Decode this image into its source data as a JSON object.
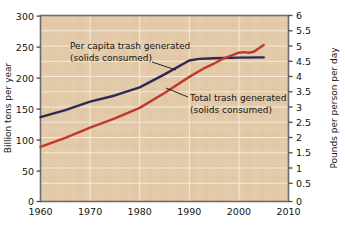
{
  "chart_data": {
    "type": "line",
    "title": "",
    "xlabel": "",
    "ylabel": "Billion tons per year",
    "y2label": "Pounds per person per day",
    "xlim": [
      1960,
      2010
    ],
    "ylim": [
      0,
      300
    ],
    "y2lim": [
      0,
      6
    ],
    "grid": true,
    "legend_position": "inline-annotations",
    "x_ticks": [
      "1960",
      "1970",
      "1980",
      "1990",
      "2000",
      "2010"
    ],
    "x_tick_values": [
      1960,
      1970,
      1980,
      1990,
      2000,
      2010
    ],
    "y_ticks": [
      "0",
      "50",
      "100",
      "150",
      "200",
      "250",
      "300"
    ],
    "y_tick_values": [
      0,
      50,
      100,
      150,
      200,
      250,
      300
    ],
    "y2_ticks": [
      "0",
      "0.5",
      "1",
      "1.5",
      "2",
      "2.5",
      "3",
      "3.5",
      "4",
      "4.5",
      "5",
      "5.5",
      "6"
    ],
    "y2_tick_values": [
      0,
      0.5,
      1,
      1.5,
      2,
      2.5,
      3,
      3.5,
      4,
      4.5,
      5,
      5.5,
      6
    ],
    "series": [
      {
        "name": "Per capita trash generated (solids consumed)",
        "axis": "right",
        "color": "#2c2a55",
        "x": [
          1960,
          1965,
          1970,
          1975,
          1980,
          1985,
          1990,
          1992,
          1995,
          2000,
          2005
        ],
        "values": [
          2.72,
          2.95,
          3.22,
          3.42,
          3.68,
          4.1,
          4.55,
          4.6,
          4.62,
          4.64,
          4.65
        ]
      },
      {
        "name": "Total trash generated (solids consumed)",
        "axis": "right",
        "color": "#c0392b",
        "x": [
          1960,
          1965,
          1970,
          1975,
          1980,
          1985,
          1990,
          1993,
          1995,
          1997,
          2000,
          2001,
          2002,
          2003,
          2005
        ],
        "values": [
          1.76,
          2.05,
          2.38,
          2.68,
          3.02,
          3.5,
          4.02,
          4.3,
          4.45,
          4.62,
          4.8,
          4.82,
          4.8,
          4.83,
          5.05
        ]
      }
    ],
    "annotations": [
      {
        "id": "per-capita",
        "line1": "Per capita trash generated",
        "line2": "(solids consumed)",
        "x": 70,
        "y": 49,
        "leader": {
          "x1": 152,
          "y1": 62,
          "x2": 176,
          "y2": 70
        }
      },
      {
        "id": "total-trash",
        "line1": "Total trash generated",
        "line2": "(solids consumed)",
        "x": 190,
        "y": 98,
        "leader": {
          "x1": 188,
          "y1": 97,
          "x2": 166,
          "y2": 88
        }
      }
    ],
    "colors": {
      "plot_background": "#e3c8a8",
      "gridline": "#f4e6d4",
      "frame": "#6d6d6d",
      "navy_series": "#2c2a55",
      "red_series": "#c0392b",
      "text": "#141414"
    }
  }
}
